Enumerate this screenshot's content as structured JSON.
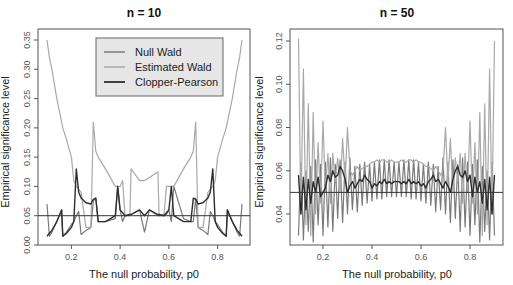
{
  "chart_data": [
    {
      "type": "line",
      "title": "n = 10",
      "xlabel": "The null probability, p0",
      "ylabel": "Empirical significance level",
      "xlim": [
        0.1,
        0.9
      ],
      "ylim": [
        0.0,
        0.35
      ],
      "xticks": [
        "0.2",
        "0.4",
        "0.6",
        "0.8"
      ],
      "yticks": [
        "0.00",
        "0.05",
        "0.10",
        "0.15",
        "0.20",
        "0.25",
        "0.30",
        "0.35"
      ],
      "reference_line": 0.05,
      "legend": {
        "position": "top-center",
        "entries": [
          "Null Wald",
          "Estimated Wald",
          "Clopper-Pearson"
        ]
      },
      "x": [
        0.1,
        0.11,
        0.12,
        0.14,
        0.16,
        0.165,
        0.18,
        0.2,
        0.21,
        0.22,
        0.23,
        0.24,
        0.26,
        0.28,
        0.29,
        0.3,
        0.31,
        0.34,
        0.38,
        0.39,
        0.4,
        0.41,
        0.42,
        0.44,
        0.445,
        0.48,
        0.5,
        0.52,
        0.555,
        0.56,
        0.58,
        0.59,
        0.6,
        0.61,
        0.62,
        0.66,
        0.69,
        0.7,
        0.71,
        0.72,
        0.74,
        0.76,
        0.77,
        0.78,
        0.79,
        0.8,
        0.82,
        0.835,
        0.84,
        0.86,
        0.88,
        0.89,
        0.9
      ],
      "series": [
        {
          "name": "Null Wald",
          "color": "#7a7a7a",
          "values": [
            0.07,
            0.015,
            0.022,
            0.04,
            0.06,
            0.015,
            0.022,
            0.035,
            0.04,
            0.05,
            0.057,
            0.018,
            0.025,
            0.03,
            0.075,
            0.08,
            0.04,
            0.04,
            0.045,
            0.1,
            0.06,
            0.04,
            0.05,
            0.052,
            0.052,
            0.06,
            0.022,
            0.06,
            0.05,
            0.05,
            0.052,
            0.052,
            0.06,
            0.04,
            0.1,
            0.045,
            0.04,
            0.04,
            0.08,
            0.03,
            0.025,
            0.018,
            0.057,
            0.05,
            0.04,
            0.035,
            0.022,
            0.015,
            0.06,
            0.04,
            0.022,
            0.015,
            0.07
          ]
        },
        {
          "name": "Estimated Wald",
          "color": "#a9a9a9",
          "values": [
            0.35,
            0.32,
            0.3,
            0.25,
            0.21,
            0.2,
            0.18,
            0.15,
            0.11,
            0.1,
            0.095,
            0.09,
            0.03,
            0.03,
            0.21,
            0.16,
            0.15,
            0.13,
            0.1,
            0.1,
            0.1,
            0.11,
            0.05,
            0.05,
            0.13,
            0.11,
            0.11,
            0.115,
            0.125,
            0.05,
            0.05,
            0.1,
            0.1,
            0.1,
            0.1,
            0.13,
            0.15,
            0.16,
            0.21,
            0.03,
            0.03,
            0.09,
            0.095,
            0.1,
            0.11,
            0.15,
            0.18,
            0.2,
            0.21,
            0.25,
            0.3,
            0.32,
            0.35
          ]
        },
        {
          "name": "Clopper-Pearson",
          "color": "#2e2e2e",
          "values": [
            0.015,
            0.02,
            0.025,
            0.04,
            0.06,
            0.015,
            0.02,
            0.03,
            0.04,
            0.13,
            0.09,
            0.08,
            0.072,
            0.07,
            0.078,
            0.08,
            0.04,
            0.04,
            0.05,
            0.1,
            0.06,
            0.055,
            0.05,
            0.052,
            0.052,
            0.06,
            0.05,
            0.06,
            0.052,
            0.052,
            0.05,
            0.055,
            0.06,
            0.1,
            0.05,
            0.04,
            0.04,
            0.08,
            0.078,
            0.07,
            0.072,
            0.08,
            0.09,
            0.13,
            0.04,
            0.03,
            0.02,
            0.015,
            0.06,
            0.04,
            0.025,
            0.02,
            0.015
          ]
        }
      ]
    },
    {
      "type": "line",
      "title": "n = 50",
      "xlabel": "The null probability, p0",
      "ylabel": "Empirical significance level",
      "xlim": [
        0.1,
        0.9
      ],
      "ylim": [
        0.02,
        0.125
      ],
      "xticks": [
        "0.2",
        "0.4",
        "0.6",
        "0.8"
      ],
      "yticks": [
        "0.04",
        "0.06",
        "0.08",
        "0.10",
        "0.12"
      ],
      "reference_line": 0.05,
      "x": [
        0.1,
        0.11,
        0.12,
        0.13,
        0.14,
        0.15,
        0.16,
        0.17,
        0.18,
        0.19,
        0.2,
        0.21,
        0.22,
        0.23,
        0.24,
        0.25,
        0.26,
        0.27,
        0.28,
        0.29,
        0.3,
        0.31,
        0.32,
        0.33,
        0.34,
        0.35,
        0.36,
        0.37,
        0.38,
        0.39,
        0.4,
        0.41,
        0.42,
        0.43,
        0.44,
        0.45,
        0.46,
        0.47,
        0.48,
        0.49,
        0.5,
        0.51,
        0.52,
        0.53,
        0.54,
        0.55,
        0.56,
        0.57,
        0.58,
        0.59,
        0.6,
        0.61,
        0.62,
        0.63,
        0.64,
        0.65,
        0.66,
        0.67,
        0.68,
        0.69,
        0.7,
        0.71,
        0.72,
        0.73,
        0.74,
        0.75,
        0.76,
        0.77,
        0.78,
        0.79,
        0.8,
        0.81,
        0.82,
        0.83,
        0.84,
        0.85,
        0.86,
        0.87,
        0.88,
        0.89,
        0.9
      ],
      "series": [
        {
          "name": "Null Wald",
          "color": "#7a7a7a",
          "values": [
            0.03,
            0.064,
            0.028,
            0.06,
            0.032,
            0.062,
            0.027,
            0.065,
            0.035,
            0.063,
            0.03,
            0.064,
            0.034,
            0.066,
            0.032,
            0.063,
            0.038,
            0.065,
            0.036,
            0.064,
            0.04,
            0.066,
            0.042,
            0.062,
            0.041,
            0.063,
            0.044,
            0.064,
            0.045,
            0.063,
            0.046,
            0.064,
            0.047,
            0.065,
            0.047,
            0.065,
            0.048,
            0.065,
            0.048,
            0.064,
            0.048,
            0.064,
            0.048,
            0.065,
            0.048,
            0.065,
            0.047,
            0.065,
            0.047,
            0.064,
            0.046,
            0.063,
            0.045,
            0.064,
            0.044,
            0.063,
            0.041,
            0.062,
            0.042,
            0.066,
            0.04,
            0.064,
            0.036,
            0.065,
            0.038,
            0.063,
            0.032,
            0.066,
            0.034,
            0.064,
            0.03,
            0.063,
            0.035,
            0.065,
            0.027,
            0.062,
            0.032,
            0.06,
            0.028,
            0.064,
            0.03
          ]
        },
        {
          "name": "Estimated Wald",
          "color": "#a9a9a9",
          "values": [
            0.121,
            0.04,
            0.107,
            0.035,
            0.091,
            0.03,
            0.087,
            0.04,
            0.073,
            0.045,
            0.083,
            0.05,
            0.068,
            0.045,
            0.068,
            0.055,
            0.066,
            0.05,
            0.075,
            0.055,
            0.08,
            0.06,
            0.058,
            0.06,
            0.062,
            0.06,
            0.061,
            0.062,
            0.062,
            0.063,
            0.064,
            0.064,
            0.065,
            0.064,
            0.065,
            0.065,
            0.064,
            0.064,
            0.065,
            0.064,
            0.064,
            0.064,
            0.065,
            0.064,
            0.064,
            0.065,
            0.065,
            0.064,
            0.065,
            0.064,
            0.064,
            0.063,
            0.062,
            0.062,
            0.061,
            0.06,
            0.062,
            0.06,
            0.058,
            0.06,
            0.08,
            0.055,
            0.075,
            0.05,
            0.066,
            0.055,
            0.068,
            0.045,
            0.068,
            0.05,
            0.083,
            0.045,
            0.073,
            0.04,
            0.087,
            0.03,
            0.091,
            0.035,
            0.107,
            0.04,
            0.12
          ]
        },
        {
          "name": "Clopper-Pearson",
          "color": "#2e2e2e",
          "values": [
            0.058,
            0.04,
            0.057,
            0.042,
            0.056,
            0.045,
            0.055,
            0.05,
            0.057,
            0.048,
            0.05,
            0.052,
            0.058,
            0.055,
            0.06,
            0.057,
            0.058,
            0.062,
            0.06,
            0.056,
            0.05,
            0.053,
            0.055,
            0.052,
            0.054,
            0.056,
            0.055,
            0.058,
            0.056,
            0.055,
            0.052,
            0.054,
            0.053,
            0.055,
            0.054,
            0.056,
            0.054,
            0.055,
            0.054,
            0.055,
            0.055,
            0.055,
            0.054,
            0.055,
            0.054,
            0.056,
            0.054,
            0.055,
            0.054,
            0.055,
            0.053,
            0.054,
            0.052,
            0.055,
            0.056,
            0.058,
            0.055,
            0.056,
            0.054,
            0.052,
            0.055,
            0.053,
            0.05,
            0.056,
            0.06,
            0.062,
            0.058,
            0.057,
            0.06,
            0.055,
            0.058,
            0.048,
            0.057,
            0.05,
            0.055,
            0.045,
            0.056,
            0.042,
            0.057,
            0.04,
            0.058
          ]
        }
      ]
    }
  ]
}
